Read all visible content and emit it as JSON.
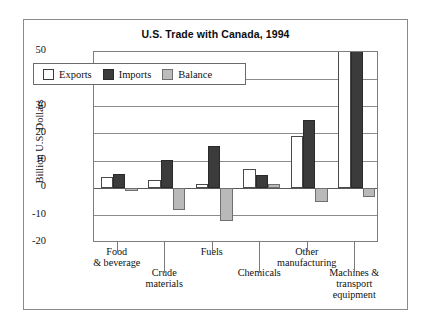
{
  "figure": {
    "title": "U.S. Trade with Canada, 1994"
  },
  "chart_data": {
    "type": "bar",
    "title": "U.S. Trade with Canada, 1994",
    "xlabel": "",
    "ylabel": "Billion U.S. Dollars",
    "ylim": [
      -20,
      50
    ],
    "yticks": [
      "50",
      "40",
      "30",
      "20",
      "10",
      "0",
      "-10",
      "-20"
    ],
    "ytick_values": [
      50,
      40,
      30,
      20,
      10,
      0,
      -10,
      -20
    ],
    "grid": true,
    "legend_position": "upper-left-inside",
    "categories": [
      "Food\n& beverage",
      "Crude\nmaterials",
      "Fuels",
      "Chemicals",
      "Other\nmanufacturing",
      "Machines &\ntransport\nequipment"
    ],
    "category_lines": [
      [
        "Food",
        "& beverage"
      ],
      [
        "Crude",
        "materials"
      ],
      [
        "Fuels"
      ],
      [
        "Chemicals"
      ],
      [
        "Other",
        "manufacturing"
      ],
      [
        "Machines &",
        "transport",
        "equipment"
      ]
    ],
    "series": [
      {
        "name": "Exports",
        "color": "#ffffff",
        "values": [
          4.3,
          3.0,
          1.5,
          7.0,
          19.3,
          53.0
        ]
      },
      {
        "name": "Imports",
        "color": "#3b3b3b",
        "values": [
          5.3,
          10.5,
          15.5,
          5.0,
          25.0,
          52.0
        ]
      },
      {
        "name": "Balance",
        "color": "#b9b9b9",
        "values": [
          -1.0,
          -8.0,
          -12.0,
          1.5,
          -5.0,
          -3.0
        ]
      }
    ]
  },
  "legend": {
    "items": [
      {
        "label": "Exports",
        "swatch": "exports-swatch"
      },
      {
        "label": "Imports",
        "swatch": "imports-swatch"
      },
      {
        "label": "Balance",
        "swatch": "balance-swatch"
      }
    ]
  }
}
